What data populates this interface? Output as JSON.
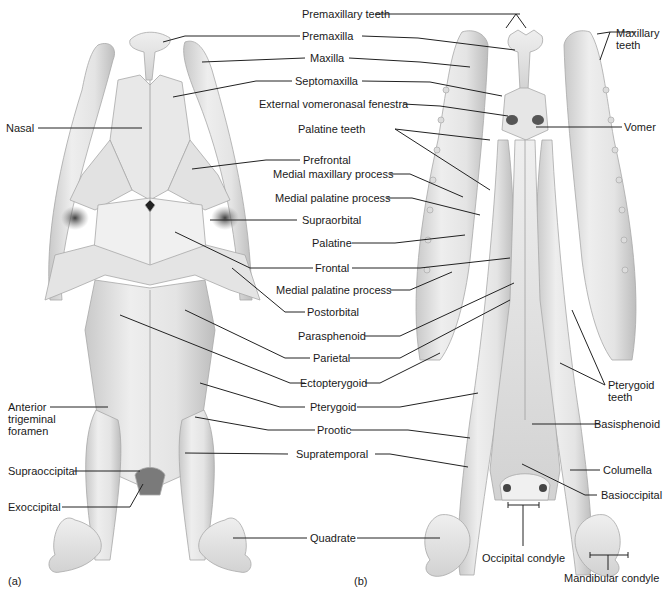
{
  "figure": {
    "panels": [
      {
        "id": "a",
        "label": "(a)",
        "view": "dorsal"
      },
      {
        "id": "b",
        "label": "(b)",
        "view": "ventral"
      }
    ],
    "colors": {
      "bone_light": "#ededed",
      "bone_mid": "#d8d8d8",
      "bone_shadow": "#b8b8b8",
      "bone_dark": "#6a6a6a",
      "leader_line": "#222222",
      "text": "#1a1a1a"
    }
  },
  "labels": {
    "premaxillary_teeth": "Premaxillary teeth",
    "premaxilla": "Premaxilla",
    "maxilla": "Maxilla",
    "septomaxilla": "Septomaxilla",
    "external_vomeronasal_fenestra": "External vomeronasal fenestra",
    "palatine_teeth": "Palatine teeth",
    "prefrontal": "Prefrontal",
    "medial_maxillary_process": "Medial maxillary process",
    "medial_palatine_process_1": "Medial palatine process",
    "supraorbital": "Supraorbital",
    "palatine": "Palatine",
    "frontal": "Frontal",
    "medial_palatine_process_2": "Medial palatine process",
    "postorbital": "Postorbital",
    "parasphenoid": "Parasphenoid",
    "parietal": "Parietal",
    "ectopterygoid": "Ectopterygoid",
    "pterygoid": "Pterygoid",
    "prootic": "Prootic",
    "supratemporal": "Supratemporal",
    "quadrate": "Quadrate",
    "nasal": "Nasal",
    "anterior_trigeminal_foramen": "Anterior\ntrigeminal\nforamen",
    "supraoccipital": "Supraoccipital",
    "exoccipital": "Exoccipital",
    "maxillary_teeth": "Maxillary\nteeth",
    "vomer": "Vomer",
    "pterygoid_teeth": "Pterygoid\nteeth",
    "basisphenoid": "Basisphenoid",
    "columella": "Columella",
    "basioccipital": "Basioccipital",
    "occipital_condyle": "Occipital condyle",
    "mandibular_condyle": "Mandibular condyle"
  }
}
